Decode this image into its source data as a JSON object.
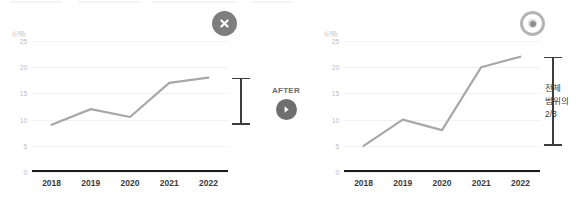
{
  "meta": {
    "after_label": "AFTER",
    "arrow_icon": "chevron-right-icon"
  },
  "panels": [
    {
      "id": "before",
      "status_icon": "circle-x-icon",
      "status_meaning": "incorrect",
      "unit_caption": "(단위)",
      "range_note": []
    },
    {
      "id": "after",
      "status_icon": "target-icon",
      "status_meaning": "correct",
      "unit_caption": "(단위)",
      "range_note": [
        "전체",
        "범위의",
        "2/3"
      ]
    }
  ],
  "chart_data": [
    {
      "type": "line",
      "id": "before-chart",
      "title": "",
      "xlabel": "",
      "ylabel": "(단위)",
      "categories": [
        "2018",
        "2019",
        "2020",
        "2021",
        "2022"
      ],
      "values": [
        9,
        12,
        10.5,
        17,
        18
      ],
      "yticks": [
        0,
        5,
        10,
        15,
        20,
        25
      ],
      "ylim": [
        0,
        25
      ],
      "grid": true,
      "legend": "none",
      "series_color": "#a8a8a8",
      "annotation": {
        "kind": "range-bar",
        "from": 9,
        "to": 18,
        "label": ""
      }
    },
    {
      "type": "line",
      "id": "after-chart",
      "title": "",
      "xlabel": "",
      "ylabel": "(단위)",
      "categories": [
        "2018",
        "2019",
        "2020",
        "2021",
        "2022"
      ],
      "values": [
        5,
        10,
        8,
        20,
        22
      ],
      "yticks": [
        0,
        5,
        10,
        15,
        20,
        25
      ],
      "ylim": [
        0,
        25
      ],
      "grid": true,
      "legend": "none",
      "series_color": "#a8a8a8",
      "annotation": {
        "kind": "range-bar",
        "from": 5,
        "to": 22,
        "label": "전체 범위의 2/3"
      }
    }
  ],
  "colors": {
    "line": "#a8a8a8",
    "grid": "#f2f2f2",
    "axis": "#1a1a1a",
    "tick_text": "#bdbdbd",
    "x_text": "#3a3a3a",
    "badge_bad": "#7e7e7e",
    "badge_good": "#b4b4b4",
    "errorbar": "#3d3d3d"
  }
}
